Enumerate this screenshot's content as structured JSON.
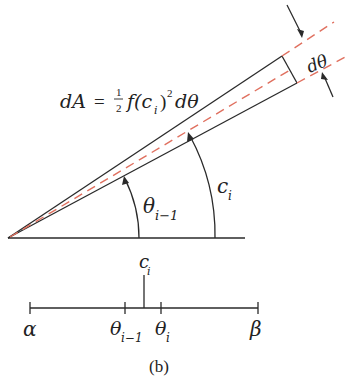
{
  "figure": {
    "caption": "(b)",
    "colors": {
      "ink": "#2a2a2a",
      "dashed_ray": "#e0705f",
      "background": "#ffffff"
    }
  },
  "sector": {
    "formula": {
      "lhs": "dA",
      "equals": "=",
      "frac_num": "1",
      "frac_den": "2",
      "func": "f(c",
      "func_sub": "i",
      "func_close": ")",
      "power": "2",
      "tail": "dθ"
    },
    "width_label": "dθ",
    "angle_labels": {
      "theta_prev": "θ",
      "theta_prev_sub": "i−1",
      "c": "c",
      "c_sub": "i"
    }
  },
  "number_line": {
    "marker_label": "c",
    "marker_sub": "i",
    "ticks": [
      {
        "label": "α",
        "sub": ""
      },
      {
        "label": "θ",
        "sub": "i−1"
      },
      {
        "label": "θ",
        "sub": "i"
      },
      {
        "label": "β",
        "sub": ""
      }
    ]
  }
}
